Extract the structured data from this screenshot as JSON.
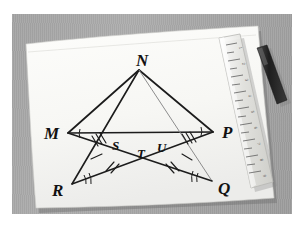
{
  "scene": {
    "description": "Photograph of a hand-drawn geometry diagram on white paper lying on a gray desk mat, with a translucent plastic ruler and a dark marker pen resting on the paper",
    "background_color": "#a6a6a6",
    "paper_color": "#f8f8f5",
    "ink_color": "#1c1c1c",
    "ruler_color": "#dcdcd8",
    "pen_color": "#2a2a2a"
  },
  "objects": [
    {
      "name": "desk-mat",
      "label": "gray desk mat"
    },
    {
      "name": "paper",
      "label": "white sheet of paper"
    },
    {
      "name": "ruler",
      "label": "transparent plastic ruler"
    },
    {
      "name": "pen",
      "label": "black marker pen"
    }
  ],
  "figure": {
    "vertices": [
      {
        "id": "N",
        "label": "N",
        "x": 133,
        "y": 62,
        "label_x": 130,
        "label_y": 58
      },
      {
        "id": "M",
        "label": "M",
        "x": 62,
        "y": 125,
        "label_x": 44,
        "label_y": 128
      },
      {
        "id": "P",
        "label": "P",
        "x": 207,
        "y": 124,
        "label_x": 218,
        "label_y": 127
      },
      {
        "id": "R",
        "label": "R",
        "x": 66,
        "y": 176,
        "label_x": 53,
        "label_y": 184
      },
      {
        "id": "Q",
        "label": "Q",
        "x": 206,
        "y": 173,
        "label_x": 215,
        "label_y": 181
      },
      {
        "id": "S",
        "label": "S",
        "x": 112,
        "y": 135,
        "label_x": 110,
        "label_y": 139
      },
      {
        "id": "T",
        "label": "T",
        "x": 136,
        "y": 142,
        "label_x": 134,
        "label_y": 147
      },
      {
        "id": "U",
        "label": "U",
        "x": 157,
        "y": 137,
        "label_x": 154,
        "label_y": 141
      }
    ],
    "segments": [
      {
        "from": "M",
        "to": "P",
        "style": "solid"
      },
      {
        "from": "N",
        "to": "M",
        "style": "solid"
      },
      {
        "from": "N",
        "to": "P",
        "style": "solid"
      },
      {
        "from": "N",
        "to": "R",
        "style": "solid"
      },
      {
        "from": "N",
        "to": "Q",
        "style": "light"
      },
      {
        "from": "M",
        "to": "Q",
        "style": "solid"
      },
      {
        "from": "P",
        "to": "R",
        "style": "solid"
      }
    ],
    "tick_marks": [
      {
        "on": "M-S",
        "count": 3
      },
      {
        "on": "U-P",
        "count": 3
      },
      {
        "on": "R-S",
        "count": 1
      },
      {
        "on": "U-Q",
        "count": 1
      },
      {
        "on": "S-T",
        "count": 2
      },
      {
        "on": "T-U",
        "count": 2
      }
    ],
    "angle_marks": [
      {
        "at": "M",
        "arcs": 1
      },
      {
        "at": "P",
        "arcs": 1
      },
      {
        "at": "R",
        "arcs": 2
      },
      {
        "at": "Q",
        "arcs": 2
      }
    ]
  },
  "ruler": {
    "name": "ruler",
    "tick_count": 17,
    "numbers": [
      "1",
      "2",
      "3",
      "4",
      "5",
      "6",
      "7",
      "8",
      "9",
      "10",
      "11",
      "12"
    ]
  }
}
